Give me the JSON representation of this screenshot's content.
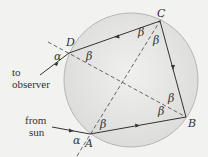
{
  "diagram": {
    "colors": {
      "background": "#f2f2f0",
      "drop_fill": "#e4e4e2",
      "drop_stroke": "#a8a8a8",
      "ray": "#333333",
      "dashed": "#444444",
      "text": "#333333"
    },
    "points": {
      "A": "A",
      "B": "B",
      "C": "C",
      "D": "D"
    },
    "angles": {
      "alpha": "α",
      "beta": "β"
    },
    "labels": {
      "to_observer_line1": "to",
      "to_observer_line2": "observer",
      "from_sun_line1": "from",
      "from_sun_line2": "sun"
    }
  }
}
